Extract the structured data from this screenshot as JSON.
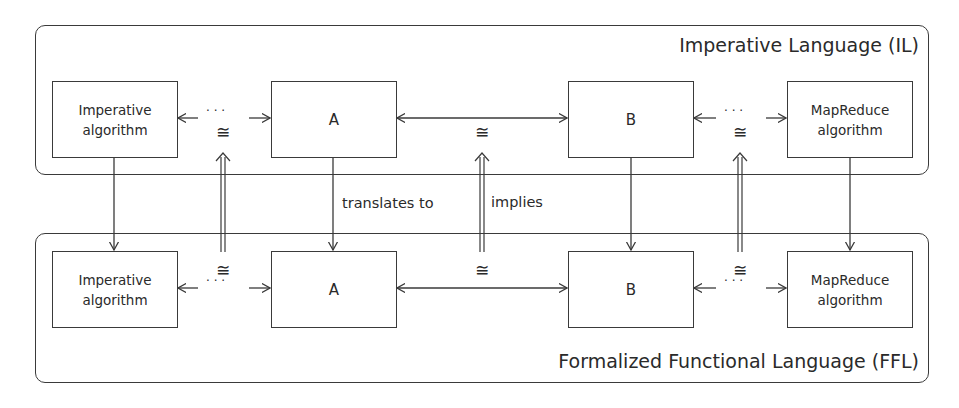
{
  "containers": {
    "top": {
      "label": "Imperative Language (IL)"
    },
    "bottom": {
      "label": "Formalized Functional Language (FFL)"
    }
  },
  "top_row": [
    {
      "id": "imperative",
      "label": "Imperative\nalgorithm"
    },
    {
      "id": "a",
      "label": "A"
    },
    {
      "id": "b",
      "label": "B"
    },
    {
      "id": "mapreduce",
      "label": "MapReduce\nalgorithm"
    }
  ],
  "bottom_row": [
    {
      "id": "imperative",
      "label": "Imperative\nalgorithm"
    },
    {
      "id": "a",
      "label": "A"
    },
    {
      "id": "b",
      "label": "B"
    },
    {
      "id": "mapreduce",
      "label": "MapReduce\nalgorithm"
    }
  ],
  "edge_labels": {
    "translates": "translates to",
    "implies": "implies",
    "congruence": "≅",
    "ellipsis": "· · ·"
  },
  "colors": {
    "stroke": "#3a3a3a",
    "text": "#2a2a2a",
    "background": "#ffffff"
  }
}
